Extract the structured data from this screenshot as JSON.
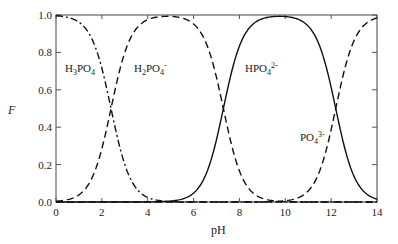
{
  "chart_data": {
    "type": "line",
    "title": "",
    "xlabel": "pH",
    "ylabel": "F",
    "xlim": [
      0,
      14
    ],
    "ylim": [
      0.0,
      1.0
    ],
    "x_ticks": [
      "0",
      "2",
      "4",
      "6",
      "8",
      "10",
      "12",
      "14"
    ],
    "y_ticks": [
      "0.0",
      "0.2",
      "0.4",
      "0.6",
      "0.8",
      "1.0"
    ],
    "grid": false,
    "legend": "inline labels",
    "pKa": [
      2.4,
      7.3,
      12.2
    ],
    "series": [
      {
        "name": "H3PO4",
        "style": "dash-dot",
        "x": [
          0,
          1,
          2,
          2.4,
          3,
          4,
          5,
          6
        ],
        "values": [
          1.0,
          0.96,
          0.72,
          0.5,
          0.2,
          0.02,
          0.0,
          0.0
        ]
      },
      {
        "name": "H2PO4-",
        "style": "dashed",
        "x": [
          0,
          1,
          2,
          2.4,
          3,
          4,
          4.85,
          6,
          7,
          7.3,
          8,
          9,
          10
        ],
        "values": [
          0.0,
          0.04,
          0.28,
          0.5,
          0.8,
          0.97,
          0.99,
          0.95,
          0.67,
          0.5,
          0.17,
          0.02,
          0.0
        ]
      },
      {
        "name": "HPO4 2-",
        "style": "solid",
        "x": [
          5,
          6,
          7,
          7.3,
          8,
          9,
          9.75,
          11,
          12,
          12.2,
          13,
          14
        ],
        "values": [
          0.0,
          0.05,
          0.33,
          0.5,
          0.83,
          0.98,
          0.99,
          0.94,
          0.61,
          0.5,
          0.14,
          0.02
        ]
      },
      {
        "name": "PO4 3-",
        "style": "dashed",
        "x": [
          9,
          10,
          11,
          12,
          12.2,
          13,
          14
        ],
        "values": [
          0.0,
          0.01,
          0.06,
          0.39,
          0.5,
          0.86,
          0.98
        ]
      }
    ],
    "annotations": [
      {
        "text": "H3PO4",
        "x": 0.4,
        "y": 0.74
      },
      {
        "text": "H2PO4-",
        "x": 3.3,
        "y": 0.74
      },
      {
        "text": "HPO4 2-",
        "x": 8.1,
        "y": 0.74
      },
      {
        "text": "PO4 3-",
        "x": 10.5,
        "y": 0.33
      }
    ]
  },
  "labels": {
    "h3po4": {
      "main": "H",
      "sub1": "3",
      "mid": "PO",
      "sub2": "4",
      "sup": ""
    },
    "h2po4": {
      "main": "H",
      "sub1": "2",
      "mid": "PO",
      "sub2": "4",
      "sup": "-"
    },
    "hpo4": {
      "main": "",
      "sub1": "",
      "mid": "HPO",
      "sub2": "4",
      "sup": "2-"
    },
    "po4": {
      "main": "",
      "sub1": "",
      "mid": "PO",
      "sub2": "4",
      "sup": "3-"
    }
  }
}
